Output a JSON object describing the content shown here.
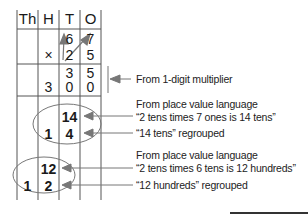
{
  "headers": [
    "Th",
    "H",
    "T",
    "O"
  ],
  "rows": {
    "multiplicand": [
      "",
      "",
      "6",
      "7"
    ],
    "multiplier": [
      "",
      "×",
      "2",
      "5"
    ],
    "partial1_top": [
      "",
      "",
      "3",
      "5"
    ],
    "partial1_bottom": [
      "",
      "3",
      "0",
      "0"
    ],
    "partial2_top": [
      "",
      "",
      "14",
      ""
    ],
    "partial2_bottom": [
      "",
      "1",
      "4",
      ""
    ],
    "partial3_top": [
      "",
      "12",
      "",
      ""
    ],
    "partial3_bottom": [
      "1",
      "2",
      "",
      ""
    ]
  },
  "annotations": {
    "one_digit": "From 1-digit multiplier",
    "pv1_line1": "From place value language",
    "pv1_line2": "“2 tens times 7 ones is 14 tens”",
    "regroup1": "“14 tens” regrouped",
    "pv2_line1": "From place value language",
    "pv2_line2": "“2 tens times 6 tens is 12 hundreds”",
    "regroup2": "“12 hundreds” regrouped"
  },
  "colors": {
    "lines": "#555555",
    "arrows": "#777777",
    "text": "#1a1a1a"
  }
}
